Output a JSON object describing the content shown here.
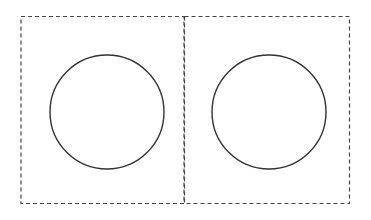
{
  "diagram": {
    "panels": [
      {
        "label": "",
        "circle": {
          "cx": 107,
          "cy": 112,
          "r": 57
        }
      },
      {
        "label": "",
        "circle": {
          "cx": 269,
          "cy": 112,
          "r": 57
        }
      }
    ],
    "colors": {
      "stroke": "#333333",
      "dashed_border": "#444444",
      "background": "#ffffff"
    }
  }
}
